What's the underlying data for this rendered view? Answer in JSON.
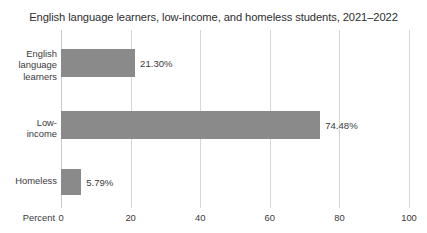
{
  "chart_data": {
    "type": "bar",
    "orientation": "horizontal",
    "title": "English language learners, low-income, and homeless students, 2021–2022",
    "xlabel": "Percent",
    "ylabel": "",
    "xlim": [
      0,
      100
    ],
    "xticks": [
      0,
      20,
      40,
      60,
      80,
      100
    ],
    "xtick_labels": [
      "0",
      "20",
      "40",
      "60",
      "80",
      "100"
    ],
    "grid": "vertical",
    "legend": "none",
    "categories": [
      "English language learners",
      "Low-income",
      "Homeless"
    ],
    "values": [
      21.3,
      74.48,
      5.79
    ],
    "value_labels": [
      "21.30%",
      "74.48%",
      "5.79%"
    ],
    "bar_color": "#8a8a8a",
    "gridline_color": "#d6d6d6",
    "text_color": "#3a3a3a"
  },
  "category_lines": [
    [
      "English",
      "language",
      "learners"
    ],
    [
      "Low-",
      "income"
    ],
    [
      "Homeless"
    ]
  ],
  "artifact": {
    "clipped_text": "·"
  }
}
